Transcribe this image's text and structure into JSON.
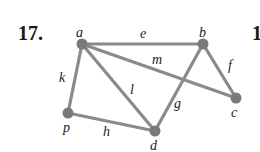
{
  "problem_number": "17.",
  "cut_off_text": "1",
  "colors": {
    "edge": "#8a8a8a",
    "node": "#7a7a7a",
    "text": "#222222"
  },
  "vertices": [
    {
      "id": "a",
      "x": 82,
      "y": 44,
      "lx": 76,
      "ly": 37
    },
    {
      "id": "b",
      "x": 203,
      "y": 44,
      "lx": 199,
      "ly": 37
    },
    {
      "id": "c",
      "x": 236,
      "y": 98,
      "lx": 231,
      "ly": 117
    },
    {
      "id": "d",
      "x": 155,
      "y": 131,
      "lx": 150,
      "ly": 150
    },
    {
      "id": "p",
      "x": 68,
      "y": 113,
      "lx": 63,
      "ly": 132
    }
  ],
  "edges": [
    {
      "label": "e",
      "from": "a",
      "to": "b",
      "lx": 140,
      "ly": 38
    },
    {
      "label": "m",
      "from": "a",
      "to": "c",
      "lx": 152,
      "ly": 64
    },
    {
      "label": "l",
      "from": "a",
      "to": "d",
      "lx": 130,
      "ly": 94
    },
    {
      "label": "k",
      "from": "a",
      "to": "p",
      "lx": 59,
      "ly": 82
    },
    {
      "label": "h",
      "from": "p",
      "to": "d",
      "lx": 103,
      "ly": 136
    },
    {
      "label": "g",
      "from": "b",
      "to": "d",
      "lx": 174,
      "ly": 108
    },
    {
      "label": "f",
      "from": "b",
      "to": "c",
      "lx": 228,
      "ly": 70
    }
  ]
}
